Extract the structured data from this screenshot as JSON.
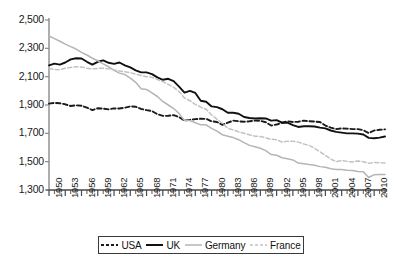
{
  "chart_data": {
    "type": "line",
    "title": "",
    "subtitle": "",
    "xlabel": "",
    "ylabel": "",
    "xlim": [
      1950,
      2012
    ],
    "ylim": [
      1300,
      2500
    ],
    "grid": false,
    "legend_position": "bottom",
    "y_ticks": [
      "1,300",
      "1,500",
      "1,700",
      "1,900",
      "2,100",
      "2,300",
      "2,500"
    ],
    "y_tick_values": [
      1300,
      1500,
      1700,
      1900,
      2100,
      2300,
      2500
    ],
    "x_ticks": [
      "1950",
      "1953",
      "1956",
      "1959",
      "1962",
      "1965",
      "1968",
      "1971",
      "1974",
      "1977",
      "1980",
      "1983",
      "1986",
      "1989",
      "1992",
      "1995",
      "1998",
      "2001",
      "2004",
      "2007",
      "2010"
    ],
    "x_tick_values": [
      1950,
      1953,
      1956,
      1959,
      1962,
      1965,
      1968,
      1971,
      1974,
      1977,
      1980,
      1983,
      1986,
      1989,
      1992,
      1995,
      1998,
      2001,
      2004,
      2007,
      2010
    ],
    "x": [
      1950,
      1951,
      1952,
      1953,
      1954,
      1955,
      1956,
      1957,
      1958,
      1959,
      1960,
      1961,
      1962,
      1963,
      1964,
      1965,
      1966,
      1967,
      1968,
      1969,
      1970,
      1971,
      1972,
      1973,
      1974,
      1975,
      1976,
      1977,
      1978,
      1979,
      1980,
      1981,
      1982,
      1983,
      1984,
      1985,
      1986,
      1987,
      1988,
      1989,
      1990,
      1991,
      1992,
      1993,
      1994,
      1995,
      1996,
      1997,
      1998,
      1999,
      2000,
      2001,
      2002,
      2003,
      2004,
      2005,
      2006,
      2007,
      2008,
      2009,
      2010,
      2011,
      2012
    ],
    "series": [
      {
        "name": "USA",
        "color": "#1a1a1a",
        "style": "dashed",
        "values": [
          1910,
          1915,
          1912,
          1905,
          1893,
          1898,
          1895,
          1881,
          1864,
          1877,
          1874,
          1869,
          1876,
          1875,
          1881,
          1890,
          1888,
          1872,
          1864,
          1857,
          1835,
          1823,
          1824,
          1828,
          1815,
          1790,
          1795,
          1800,
          1803,
          1802,
          1785,
          1780,
          1760,
          1775,
          1790,
          1785,
          1782,
          1785,
          1790,
          1788,
          1778,
          1755,
          1762,
          1775,
          1785,
          1780,
          1782,
          1790,
          1785,
          1783,
          1780,
          1755,
          1740,
          1730,
          1735,
          1733,
          1730,
          1730,
          1722,
          1702,
          1720,
          1725,
          1728
        ]
      },
      {
        "name": "UK",
        "color": "#111111",
        "style": "solid",
        "values": [
          2180,
          2192,
          2185,
          2200,
          2222,
          2230,
          2228,
          2205,
          2185,
          2205,
          2215,
          2198,
          2190,
          2200,
          2180,
          2165,
          2145,
          2130,
          2130,
          2118,
          2095,
          2078,
          2085,
          2068,
          2030,
          1988,
          2000,
          1985,
          1930,
          1923,
          1890,
          1885,
          1870,
          1845,
          1845,
          1838,
          1815,
          1808,
          1805,
          1806,
          1805,
          1790,
          1793,
          1775,
          1775,
          1758,
          1745,
          1750,
          1750,
          1748,
          1740,
          1735,
          1720,
          1710,
          1705,
          1700,
          1700,
          1698,
          1692,
          1668,
          1665,
          1670,
          1678
        ]
      },
      {
        "name": "Germany",
        "color": "#b5b5b5",
        "style": "solid",
        "values": [
          2387,
          2368,
          2350,
          2330,
          2312,
          2295,
          2272,
          2253,
          2230,
          2212,
          2190,
          2170,
          2145,
          2125,
          2115,
          2090,
          2060,
          2015,
          2010,
          1985,
          1960,
          1925,
          1900,
          1875,
          1840,
          1790,
          1790,
          1775,
          1760,
          1760,
          1735,
          1715,
          1690,
          1680,
          1670,
          1655,
          1635,
          1615,
          1605,
          1595,
          1578,
          1550,
          1545,
          1528,
          1520,
          1512,
          1490,
          1486,
          1480,
          1475,
          1465,
          1460,
          1450,
          1445,
          1445,
          1440,
          1438,
          1430,
          1428,
          1388,
          1408,
          1410,
          1410
        ]
      },
      {
        "name": "France",
        "color": "#c2c2c2",
        "style": "dashed",
        "values": [
          2160,
          2150,
          2148,
          2160,
          2165,
          2170,
          2168,
          2160,
          2155,
          2158,
          2160,
          2155,
          2148,
          2140,
          2135,
          2128,
          2118,
          2108,
          2100,
          2095,
          2080,
          2065,
          2045,
          2025,
          1995,
          1950,
          1930,
          1905,
          1885,
          1870,
          1830,
          1800,
          1770,
          1735,
          1725,
          1710,
          1700,
          1690,
          1680,
          1678,
          1668,
          1658,
          1655,
          1638,
          1645,
          1645,
          1638,
          1625,
          1615,
          1595,
          1570,
          1545,
          1518,
          1500,
          1508,
          1502,
          1498,
          1505,
          1500,
          1488,
          1495,
          1492,
          1490
        ]
      }
    ]
  },
  "legend": {
    "entries": [
      {
        "label": "USA",
        "style": "dashed",
        "color": "#1a1a1a"
      },
      {
        "label": "UK",
        "style": "solid",
        "color": "#111111"
      },
      {
        "label": "Germany",
        "style": "solid",
        "color": "#b5b5b5"
      },
      {
        "label": "France",
        "style": "dashed",
        "color": "#c2c2c2"
      }
    ]
  },
  "axes": {
    "y_axis_color": "#8a8a8a",
    "x_axis_color": "#4a4a4a"
  }
}
